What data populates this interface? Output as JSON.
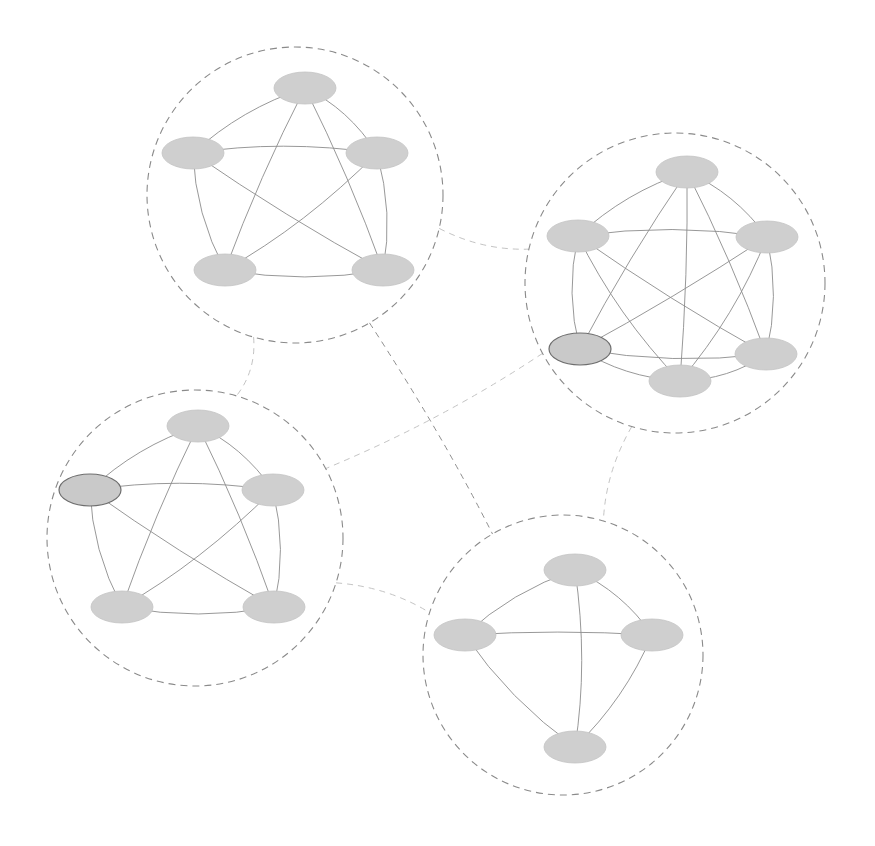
{
  "diagram": {
    "type": "clustered-network",
    "colors": {
      "background": "#ffffff",
      "node_fill": "#cfcfcf",
      "edge": "#8c8c8c",
      "cluster_boundary": "#8a8a8a",
      "inter_link_light": "#c4c4c4",
      "inter_link_dark": "#8e8e8e",
      "highlight_stroke": "#6e6e6e"
    },
    "clusters": [
      {
        "id": "A",
        "center": [
          295,
          195
        ],
        "radius": 148,
        "nodes": [
          {
            "id": "A1",
            "x": 305,
            "y": 88
          },
          {
            "id": "A2",
            "x": 193,
            "y": 153
          },
          {
            "id": "A3",
            "x": 377,
            "y": 153
          },
          {
            "id": "A4",
            "x": 225,
            "y": 270
          },
          {
            "id": "A5",
            "x": 383,
            "y": 270
          }
        ],
        "edges": [
          [
            "A1",
            "A2"
          ],
          [
            "A1",
            "A3"
          ],
          [
            "A1",
            "A4"
          ],
          [
            "A1",
            "A5"
          ],
          [
            "A2",
            "A3"
          ],
          [
            "A2",
            "A4"
          ],
          [
            "A2",
            "A5"
          ],
          [
            "A3",
            "A4"
          ],
          [
            "A3",
            "A5"
          ],
          [
            "A4",
            "A5"
          ]
        ]
      },
      {
        "id": "B",
        "center": [
          675,
          283
        ],
        "radius": 150,
        "nodes": [
          {
            "id": "B1",
            "x": 687,
            "y": 172
          },
          {
            "id": "B2",
            "x": 578,
            "y": 236
          },
          {
            "id": "B3",
            "x": 767,
            "y": 237
          },
          {
            "id": "B4",
            "x": 580,
            "y": 349,
            "highlight": true
          },
          {
            "id": "B5",
            "x": 766,
            "y": 354
          },
          {
            "id": "B6",
            "x": 680,
            "y": 381
          }
        ],
        "edges": [
          [
            "B1",
            "B2"
          ],
          [
            "B1",
            "B3"
          ],
          [
            "B1",
            "B4"
          ],
          [
            "B1",
            "B5"
          ],
          [
            "B1",
            "B6"
          ],
          [
            "B2",
            "B3"
          ],
          [
            "B2",
            "B4"
          ],
          [
            "B2",
            "B5"
          ],
          [
            "B2",
            "B6"
          ],
          [
            "B3",
            "B4"
          ],
          [
            "B3",
            "B5"
          ],
          [
            "B3",
            "B6"
          ],
          [
            "B4",
            "B5"
          ],
          [
            "B4",
            "B6"
          ],
          [
            "B5",
            "B6"
          ]
        ]
      },
      {
        "id": "C",
        "center": [
          195,
          538
        ],
        "radius": 148,
        "nodes": [
          {
            "id": "C1",
            "x": 198,
            "y": 426
          },
          {
            "id": "C2",
            "x": 90,
            "y": 490,
            "highlight": true
          },
          {
            "id": "C3",
            "x": 273,
            "y": 490
          },
          {
            "id": "C4",
            "x": 122,
            "y": 607
          },
          {
            "id": "C5",
            "x": 274,
            "y": 607
          }
        ],
        "edges": [
          [
            "C1",
            "C2"
          ],
          [
            "C1",
            "C3"
          ],
          [
            "C1",
            "C4"
          ],
          [
            "C1",
            "C5"
          ],
          [
            "C2",
            "C3"
          ],
          [
            "C2",
            "C4"
          ],
          [
            "C2",
            "C5"
          ],
          [
            "C3",
            "C4"
          ],
          [
            "C3",
            "C5"
          ],
          [
            "C4",
            "C5"
          ]
        ]
      },
      {
        "id": "D",
        "center": [
          563,
          655
        ],
        "radius": 140,
        "nodes": [
          {
            "id": "D1",
            "x": 575,
            "y": 570
          },
          {
            "id": "D2",
            "x": 465,
            "y": 635
          },
          {
            "id": "D3",
            "x": 652,
            "y": 635
          },
          {
            "id": "D4",
            "x": 575,
            "y": 747
          }
        ],
        "edges": [
          [
            "D1",
            "D2"
          ],
          [
            "D1",
            "D3"
          ],
          [
            "D1",
            "D4"
          ],
          [
            "D2",
            "D3"
          ],
          [
            "D2",
            "D4"
          ],
          [
            "D3",
            "D4"
          ]
        ]
      }
    ],
    "inter_cluster_links": [
      {
        "from": "A",
        "to": "B",
        "style": "light"
      },
      {
        "from": "A",
        "to": "C",
        "style": "light"
      },
      {
        "from": "A",
        "to": "D",
        "style": "dark"
      },
      {
        "from": "B",
        "to": "C",
        "style": "light"
      },
      {
        "from": "B",
        "to": "D",
        "style": "light"
      },
      {
        "from": "C",
        "to": "D",
        "style": "light"
      }
    ]
  }
}
